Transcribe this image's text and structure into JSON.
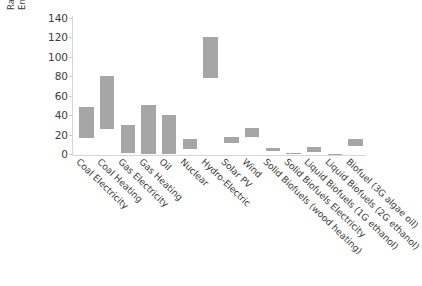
{
  "chart_data": {
    "type": "bar",
    "bar_style": "floating-range",
    "title": "",
    "xlabel": "",
    "ylabel": "Ratio of Energy Delivered versus Energy Used to Produce the Energy",
    "ylabel_lines": [
      "Ratio of Energy Delivered versus",
      "Energy Used to Produce the Energy"
    ],
    "ylim": [
      0,
      140
    ],
    "ytick_values": [
      0,
      20,
      40,
      60,
      80,
      100,
      120,
      140
    ],
    "ytick_labels": [
      "0",
      "20",
      "40",
      "60",
      "80",
      "100",
      "120",
      "140"
    ],
    "grid": false,
    "legend": "none",
    "bar_color": "#a6a6a6",
    "categories": [
      "Coal Electricity",
      "Coal Heating",
      "Gas Electricity",
      "Gas Heating",
      "Oil",
      "Nuclear",
      "Hydro-Electric",
      "Solar PV",
      "Wind",
      "Solid Biofuels (wood heating)",
      "Solid Biofuels Electricity",
      "Liquid Biofuels (1G ethanol)",
      "Liquid Biofuels (2G ethanol)",
      "Biofuel (3G algae oil)"
    ],
    "bars": [
      {
        "label": "Coal Electricity",
        "low": 16,
        "high": 48
      },
      {
        "label": "Coal Heating",
        "low": 26,
        "high": 80
      },
      {
        "label": "Gas Electricity",
        "low": 1,
        "high": 30
      },
      {
        "label": "Gas Heating",
        "low": 0,
        "high": 50
      },
      {
        "label": "Oil",
        "low": 0,
        "high": 40
      },
      {
        "label": "Nuclear",
        "low": 5,
        "high": 15
      },
      {
        "label": "Hydro-Electric",
        "low": 78,
        "high": 120
      },
      {
        "label": "Solar PV",
        "low": 11,
        "high": 18
      },
      {
        "label": "Wind",
        "low": 18,
        "high": 27
      },
      {
        "label": "Solid Biofuels (wood heating)",
        "low": 3,
        "high": 6
      },
      {
        "label": "Solid Biofuels Electricity",
        "low": 0,
        "high": 1
      },
      {
        "label": "Liquid Biofuels (1G ethanol)",
        "low": 2,
        "high": 7
      },
      {
        "label": "Liquid Biofuels (2G ethanol)",
        "low": 0,
        "high": 0
      },
      {
        "label": "Biofuel (3G algae oil)",
        "low": 8,
        "high": 15
      }
    ],
    "xtick_labels": [
      "Coal Electricity",
      "Coal Heating",
      "Gas Electricity",
      "Gas Heating",
      "Oil",
      "Nuclear",
      "Hydro-Electric",
      "Solar PV",
      "Wind",
      "Solid Biofuels (wood heating)",
      "Solid Biofuels Electricity",
      "Liquid Biofuels (1G ethanol)",
      "Liquid Biofuels (2G ethanol)",
      "Biofuel (3G algae oil)"
    ]
  }
}
